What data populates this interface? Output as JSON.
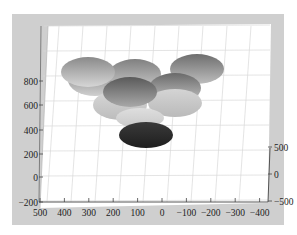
{
  "chart_data": {
    "type": "3d-surface-ellipsoids",
    "title": "",
    "xlabel": "",
    "ylabel": "",
    "zlabel": "",
    "x_ticks": [
      "500",
      "400",
      "300",
      "200",
      "100",
      "0",
      "−100",
      "−200",
      "−300",
      "−400"
    ],
    "y_ticks": [
      "500",
      "0",
      "−500"
    ],
    "z_ticks": [
      "800",
      "600",
      "400",
      "200",
      "0",
      "−200"
    ],
    "xlim": [
      -400,
      500
    ],
    "ylim": [
      -500,
      500
    ],
    "zlim": [
      -200,
      900
    ],
    "grid": true,
    "colormap": "gray",
    "ellipsoids": [
      {
        "id": 1,
        "cx": 120,
        "cy": 90,
        "rx": 27,
        "ry": 16,
        "shade_top": "#7a7a7a",
        "shade_bottom": "#cfcfcf"
      },
      {
        "id": 2,
        "cx": 160,
        "cy": 84,
        "rx": 26,
        "ry": 15,
        "shade_top": "#808080",
        "shade_bottom": "#c8c8c8"
      },
      {
        "id": 3,
        "cx": 222,
        "cy": 79,
        "rx": 27,
        "ry": 15,
        "shade_top": "#6e6e6e",
        "shade_bottom": "#bdbdbd"
      },
      {
        "id": 4,
        "cx": 113,
        "cy": 82,
        "rx": 27,
        "ry": 15,
        "shade_top": "#8a8a8a",
        "shade_bottom": "#d6d6d6"
      },
      {
        "id": 5,
        "cx": 200,
        "cy": 98,
        "rx": 26,
        "ry": 15,
        "shade_top": "#6a6a6a",
        "shade_bottom": "#c4c4c4"
      },
      {
        "id": 6,
        "cx": 145,
        "cy": 115,
        "rx": 27,
        "ry": 15,
        "shade_top": "#d8d8d8",
        "shade_bottom": "#bcbcbc"
      },
      {
        "id": 7,
        "cx": 200,
        "cy": 113,
        "rx": 27,
        "ry": 14,
        "shade_top": "#d4d4d4",
        "shade_bottom": "#bababa"
      },
      {
        "id": 8,
        "cx": 155,
        "cy": 102,
        "rx": 27,
        "ry": 15,
        "shade_top": "#5a5a5a",
        "shade_bottom": "#a8a8a8"
      },
      {
        "id": 9,
        "cx": 165,
        "cy": 128,
        "rx": 24,
        "ry": 10,
        "shade_top": "#dedede",
        "shade_bottom": "#c8c8c8"
      },
      {
        "id": 10,
        "cx": 171,
        "cy": 145,
        "rx": 27,
        "ry": 13,
        "shade_top": "#3a3a3a",
        "shade_bottom": "#1e1e1e"
      }
    ]
  }
}
